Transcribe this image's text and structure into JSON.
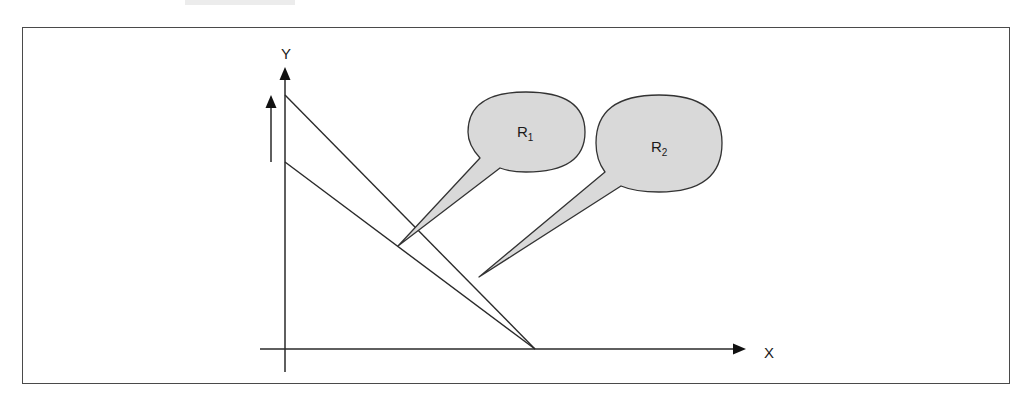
{
  "figure": {
    "type": "diagram",
    "axes": {
      "x_label": "X",
      "y_label": "Y"
    },
    "lines": [
      {
        "id": "upper",
        "start": [
          285,
          95
        ],
        "end": [
          535,
          349
        ]
      },
      {
        "id": "lower",
        "start": [
          285,
          162
        ],
        "end": [
          535,
          349
        ]
      }
    ],
    "shift_arrow": {
      "direction": "up",
      "meaning": "upward shift indicator beside Y-axis"
    },
    "callouts": [
      {
        "id": "R1",
        "label_main": "R",
        "label_sub": "1",
        "points_to": "lower line"
      },
      {
        "id": "R2",
        "label_main": "R",
        "label_sub": "2",
        "points_to": "region between lines"
      }
    ],
    "colors": {
      "stroke": "#2a2a2a",
      "bubble_fill": "#d9d9d9",
      "frame": "#4a4a4a"
    }
  }
}
